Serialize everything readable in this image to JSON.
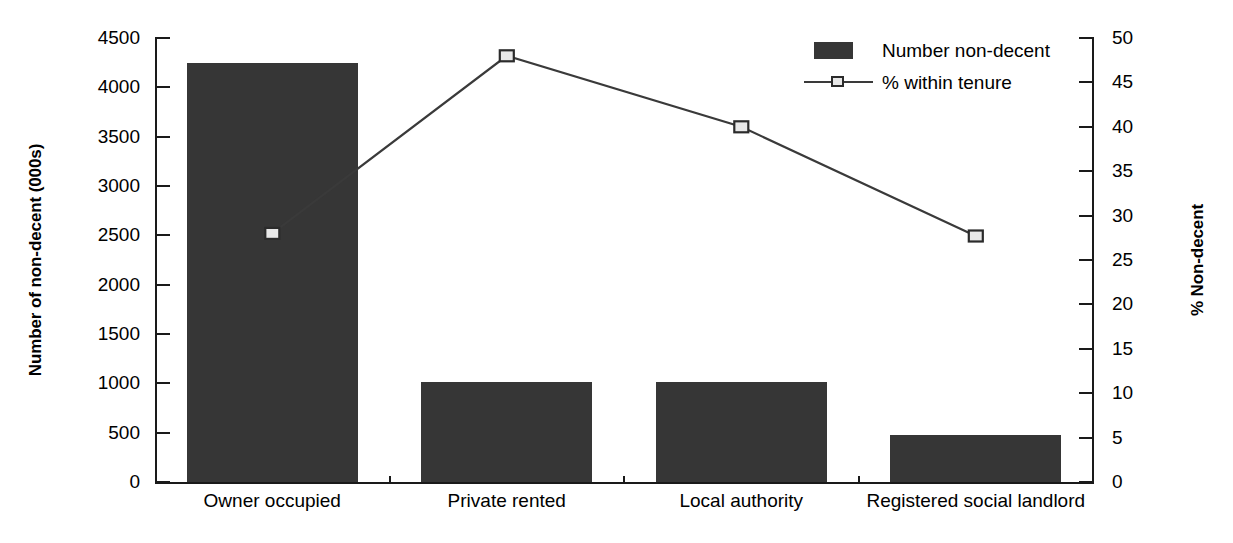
{
  "chart_data": {
    "type": "bar",
    "title": "",
    "subtitle": "",
    "categories": [
      "Owner occupied",
      "Private rented",
      "Local authority",
      "Registered social landlord"
    ],
    "series": [
      {
        "name": "Number non-decent",
        "type": "bar",
        "axis": "left",
        "values": [
          4250,
          1010,
          1010,
          480
        ],
        "color": "#363636"
      },
      {
        "name": "% within tenure",
        "type": "line",
        "axis": "right",
        "values": [
          28,
          48,
          40,
          27.7
        ],
        "color": "#3a3a3a",
        "marker": "square",
        "marker_fill": "#e8e8e8",
        "marker_border": "#2b2b2b"
      }
    ],
    "xlabel": "",
    "ylabel": "Number of non-decent (000s)",
    "y2label": "% Non-decent",
    "ylim": [
      0,
      4500
    ],
    "y2lim": [
      0,
      50
    ],
    "ytick_step": 500,
    "y2tick_step": 5,
    "yticks": [
      "0",
      "500",
      "1000",
      "1500",
      "2000",
      "2500",
      "3000",
      "3500",
      "4000",
      "4500"
    ],
    "y2ticks": [
      "0",
      "5",
      "10",
      "15",
      "20",
      "25",
      "30",
      "35",
      "40",
      "45",
      "50"
    ],
    "grid": false,
    "legend_position": "top-right",
    "legend": [
      "Number non-decent",
      "% within tenure"
    ],
    "annotations": []
  },
  "axes": {
    "left_title": "Number of non-decent (000s)",
    "right_title": "% Non-decent"
  },
  "legend": {
    "items": [
      {
        "label": "Number non-decent",
        "key": "bar-swatch-icon"
      },
      {
        "label": "% within tenure",
        "key": "line-marker-icon"
      }
    ]
  },
  "colors": {
    "bar": "#363636",
    "line": "#3a3a3a",
    "marker_fill": "#e8e8e8",
    "marker_border": "#2b2b2b",
    "axis": "#1a1a1a",
    "background": "#ffffff"
  }
}
